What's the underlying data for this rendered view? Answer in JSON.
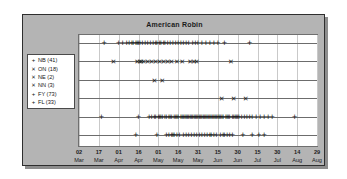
{
  "chart_data": {
    "type": "scatter",
    "title": "American Robin",
    "xlabel": "",
    "ylabel": "",
    "grid": true,
    "legend_position": "left-outside",
    "x_tick_labels": [
      {
        "day": "02",
        "month": "Mar"
      },
      {
        "day": "17",
        "month": "Mar"
      },
      {
        "day": "01",
        "month": "Apr"
      },
      {
        "day": "16",
        "month": "Apr"
      },
      {
        "day": "01",
        "month": "May"
      },
      {
        "day": "16",
        "month": "May"
      },
      {
        "day": "31",
        "month": "May"
      },
      {
        "day": "15",
        "month": "Jun"
      },
      {
        "day": "30",
        "month": "Jun"
      },
      {
        "day": "15",
        "month": "Jul"
      },
      {
        "day": "30",
        "month": "Jul"
      },
      {
        "day": "14",
        "month": "Aug"
      },
      {
        "day": "29",
        "month": "Aug"
      }
    ],
    "xlim_days": [
      0,
      180
    ],
    "series": [
      {
        "name": "NB",
        "label": "NB (41)",
        "count": 41,
        "symbol": "plus",
        "row": 0,
        "x": [
          19,
          30,
          33,
          36,
          38,
          40,
          41,
          43,
          44,
          45,
          46,
          48,
          50,
          52,
          54,
          56,
          58,
          59,
          61,
          62,
          64,
          65,
          67,
          69,
          71,
          73,
          75,
          77,
          79,
          81,
          83,
          86,
          88,
          90,
          93,
          96,
          99,
          102,
          105,
          110,
          129
        ]
      },
      {
        "name": "ON",
        "label": "ON (18)",
        "count": 18,
        "symbol": "ex",
        "row": 1,
        "x": [
          26,
          44,
          46,
          47,
          49,
          52,
          55,
          58,
          61,
          64,
          67,
          70,
          74,
          78,
          84,
          87,
          89,
          115
        ]
      },
      {
        "name": "NE",
        "label": "NE (2)",
        "count": 2,
        "symbol": "ex",
        "row": 2,
        "x": [
          57,
          63
        ]
      },
      {
        "name": "NN",
        "label": "NN (3)",
        "count": 3,
        "symbol": "ex",
        "row": 3,
        "x": [
          108,
          117,
          126
        ]
      },
      {
        "name": "FY",
        "label": "FY (73)",
        "count": 73,
        "symbol": "plus",
        "row": 4,
        "x": [
          17,
          45,
          53,
          55,
          57,
          58,
          60,
          61,
          62,
          63,
          65,
          66,
          68,
          69,
          70,
          72,
          73,
          74,
          75,
          77,
          78,
          79,
          80,
          81,
          82,
          83,
          84,
          85,
          86,
          87,
          88,
          89,
          90,
          91,
          92,
          93,
          94,
          95,
          96,
          97,
          98,
          99,
          100,
          101,
          102,
          103,
          104,
          105,
          106,
          107,
          108,
          109,
          111,
          112,
          113,
          114,
          116,
          117,
          118,
          119,
          120,
          121,
          123,
          125,
          127,
          129,
          131,
          134,
          137,
          140,
          143,
          146,
          163
        ]
      },
      {
        "name": "FL",
        "label": "FL (33)",
        "count": 33,
        "symbol": "plus",
        "row": 5,
        "x": [
          43,
          59,
          66,
          68,
          70,
          71,
          72,
          74,
          76,
          79,
          81,
          83,
          85,
          87,
          89,
          91,
          93,
          95,
          97,
          99,
          100,
          102,
          104,
          107,
          109,
          110,
          112,
          114,
          116,
          124,
          131,
          136,
          140
        ]
      }
    ]
  },
  "legend": {
    "items": [
      {
        "symbol": "+",
        "symbol_kind": "plus",
        "label": "NB (41)"
      },
      {
        "symbol": "✕",
        "symbol_kind": "ex",
        "label": "ON (18)"
      },
      {
        "symbol": "✕",
        "symbol_kind": "ex",
        "label": "NE (2)"
      },
      {
        "symbol": "✕",
        "symbol_kind": "ex",
        "label": "NN (3)"
      },
      {
        "symbol": "+",
        "symbol_kind": "plus",
        "label": "FY (73)"
      },
      {
        "symbol": "+",
        "symbol_kind": "plus",
        "label": "FL (33)"
      }
    ]
  },
  "colors": {
    "panel_background": "#b4b4b4",
    "plot_background": "#ffffff",
    "marker": "#1a1a1a",
    "gridline": "#c9c9c9",
    "baseline": "#6c6c6c",
    "border": "#2e2e2e"
  }
}
